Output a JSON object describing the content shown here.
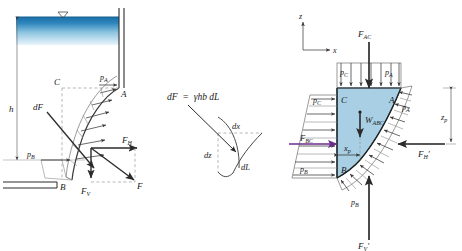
{
  "figure": {
    "panels": [
      "left-curved-gate",
      "center-differential-element",
      "right-free-body"
    ]
  },
  "colors": {
    "water_top": "#1b6fa8",
    "water_bottom": "#d8ecf7",
    "body_fill": "#a8cfe4",
    "line": "#2b2b2b",
    "dash": "#8a8a8a",
    "accent_fbc": "#6b2d8c"
  },
  "left_panel": {
    "labels": {
      "water_surface_symbol": "triangle-down",
      "depth": "h",
      "point_a": "A",
      "point_b": "B",
      "point_c": "C",
      "pressure_a": "p",
      "pressure_a_sub": "A",
      "pressure_b": "p",
      "pressure_b_sub": "B",
      "differential_force": "dF",
      "horizontal_force": "F",
      "horizontal_force_sub": "H",
      "vertical_force": "F",
      "vertical_force_sub": "V",
      "resultant_force": "F"
    }
  },
  "center_panel": {
    "equation": {
      "lhs": "dF",
      "eq": "=",
      "rhs": "γhb dL"
    },
    "labels": {
      "dx": "dx",
      "dz": "dz",
      "dL": "dL"
    }
  },
  "right_panel": {
    "axes": {
      "z_label": "z",
      "x_label": "x"
    },
    "labels": {
      "force_ac": "F",
      "force_ac_sub": "AC",
      "pressure_c_top": "p",
      "pressure_c_top_sub": "C",
      "pressure_a_top": "p",
      "pressure_a_top_sub": "A",
      "pressure_c_left": "p",
      "pressure_c_left_sub": "C",
      "pressure_a_right": "p",
      "pressure_a_right_sub": "A",
      "pressure_b_left": "p",
      "pressure_b_left_sub": "B",
      "pressure_b_lower": "p",
      "pressure_b_lower_sub": "B",
      "force_bc": "F",
      "force_bc_sub": "BC",
      "weight": "W",
      "weight_sub": "ABC",
      "centroid_x": "x",
      "centroid_x_sub": "p",
      "depth_zp": "z",
      "depth_zp_sub": "p",
      "force_h_prime": "F",
      "force_h_prime_sub": "H",
      "force_h_prime_mark": "′",
      "force_v_prime": "F",
      "force_v_prime_sub": "V",
      "force_v_prime_mark": "′",
      "point_a": "A",
      "point_b": "B",
      "point_c": "C"
    }
  }
}
